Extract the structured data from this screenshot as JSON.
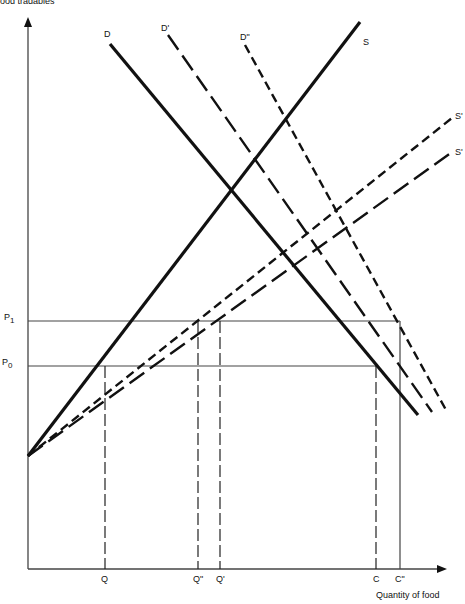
{
  "axes": {
    "y_label": "ood tradables",
    "x_label": "Quantity of food"
  },
  "curves": {
    "D": "D",
    "D_prime": "D'",
    "D_double_prime": "D\"",
    "S": "S",
    "S_prime_upper": "S'",
    "S_prime_lower": "S'"
  },
  "price_levels": {
    "P1": {
      "base": "P",
      "sub": "1"
    },
    "P0": {
      "base": "P",
      "sub": "0"
    }
  },
  "quantities": {
    "Q": "Q",
    "Q_double_prime": "Q\"",
    "Q_prime": "Q'",
    "C": "C",
    "C_double_prime": "C\""
  },
  "colors": {
    "line": "#111111",
    "axis": "#555555",
    "background": "#ffffff"
  }
}
